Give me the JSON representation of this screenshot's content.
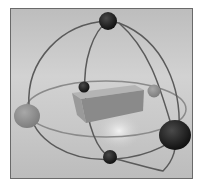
{
  "illustration": {
    "subject": "3D rotation gizmo around a box",
    "colors": {
      "frame_border": "#6a6a6a",
      "background": "#c8c8c8",
      "ring": "#5a5a5a",
      "handle_dark": "#1c1c1c",
      "handle_gray": "#8e8e8e",
      "box_top": "#b4b4b4",
      "box_front": "#8a8a8a",
      "box_side": "#9a9a9a"
    }
  }
}
